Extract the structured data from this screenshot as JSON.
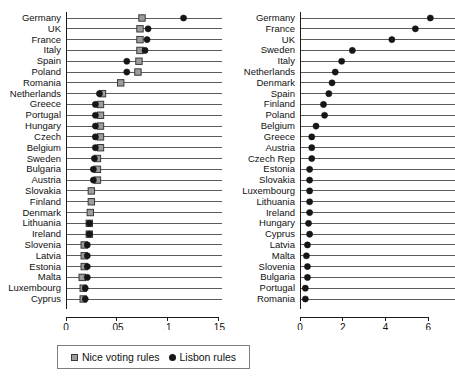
{
  "chart_data": [
    {
      "type": "scatter",
      "panel": "left",
      "title": "",
      "xlabel": "",
      "ylabel": "",
      "xlim": [
        0,
        0.15
      ],
      "xticks": [
        0,
        0.05,
        0.1,
        0.15
      ],
      "xtick_labels": [
        "0",
        ".05",
        ".1",
        ".15"
      ],
      "grid": false,
      "orientation": "horizontal-lollipop",
      "legend_position": "bottom",
      "categories": [
        "Germany",
        "UK",
        "France",
        "Italy",
        "Spain",
        "Poland",
        "Romania",
        "Netherlands",
        "Greece",
        "Portugal",
        "Hungary",
        "Czech",
        "Belgium",
        "Sweden",
        "Bulgaria",
        "Austria",
        "Slovakia",
        "Finland",
        "Denmark",
        "Lithuania",
        "Ireland",
        "Slovenia",
        "Latvia",
        "Estonia",
        "Malta",
        "Luxembourg",
        "Cyprus"
      ],
      "series": [
        {
          "name": "Nice voting rules",
          "marker": "square",
          "color": "#9d9d9d",
          "values": [
            0.075,
            0.073,
            0.073,
            0.073,
            0.072,
            0.071,
            0.054,
            0.036,
            0.034,
            0.034,
            0.034,
            0.034,
            0.034,
            0.031,
            0.031,
            0.031,
            0.025,
            0.025,
            0.024,
            0.023,
            0.023,
            0.018,
            0.018,
            0.018,
            0.016,
            0.017,
            0.017
          ]
        },
        {
          "name": "Lisbon rules",
          "marker": "circle",
          "color": "#161616",
          "values": [
            0.116,
            0.081,
            0.08,
            0.078,
            0.06,
            0.06,
            0.0,
            0.033,
            0.029,
            0.029,
            0.029,
            0.029,
            0.029,
            0.028,
            0.027,
            0.027,
            0.0,
            0.0,
            0.0,
            0.023,
            0.023,
            0.021,
            0.021,
            0.021,
            0.021,
            0.019,
            0.019
          ]
        }
      ]
    },
    {
      "type": "scatter",
      "panel": "right",
      "title": "",
      "xlabel": "Influential partners",
      "ylabel": "",
      "xlim": [
        0,
        6.6
      ],
      "xticks": [
        0,
        2,
        4,
        6
      ],
      "xtick_labels": [
        "0",
        "2",
        "4",
        "6"
      ],
      "grid": false,
      "orientation": "horizontal-lollipop",
      "categories": [
        "Germany",
        "France",
        "UK",
        "Sweden",
        "Italy",
        "Netherlands",
        "Denmark",
        "Spain",
        "Finland",
        "Poland",
        "Belgium",
        "Greece",
        "Austria",
        "Czech Rep",
        "Estonia",
        "Slovakia",
        "Luxembourg",
        "Lithuania",
        "Ireland",
        "Hungary",
        "Cyprus",
        "Latvia",
        "Malta",
        "Slovenia",
        "Bulgaria",
        "Portugal",
        "Romania"
      ],
      "series": [
        {
          "name": "Influential partners",
          "marker": "circle",
          "color": "#161616",
          "values": [
            6.1,
            5.4,
            4.3,
            2.45,
            1.95,
            1.65,
            1.5,
            1.35,
            1.1,
            1.15,
            0.75,
            0.55,
            0.55,
            0.55,
            0.45,
            0.45,
            0.45,
            0.45,
            0.45,
            0.4,
            0.45,
            0.35,
            0.3,
            0.35,
            0.35,
            0.25,
            0.25
          ]
        }
      ]
    }
  ],
  "legend": {
    "items": [
      {
        "label": "Nice voting rules",
        "marker": "square"
      },
      {
        "label": "Lisbon rules",
        "marker": "circle"
      }
    ]
  }
}
